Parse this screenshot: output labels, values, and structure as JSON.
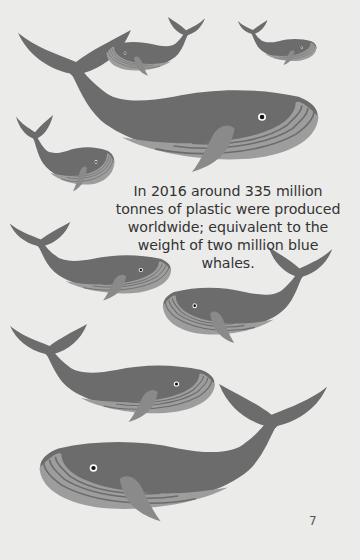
{
  "page": {
    "caption": "In 2016 around 335 million tonnes of plastic were produced worldwide; equivalent to the weight of two million blue whales.",
    "page_number": "7"
  },
  "colors": {
    "background": "#ebebea",
    "whale_body": "#6c6c6c",
    "whale_belly": "#9d9d9d",
    "belly_lines": "#6c6c6c"
  },
  "illustration": {
    "subject": "blue whales",
    "count": 9
  }
}
